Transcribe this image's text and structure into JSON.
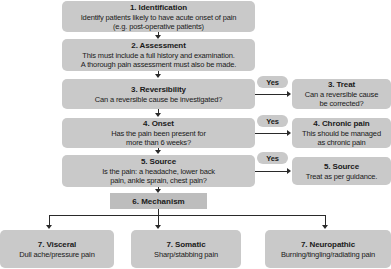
{
  "diagram": {
    "colors": {
      "box_fill": "#c9c9c9",
      "mechanism_fill": "#bdbdbd",
      "connector": "#2a2a2a",
      "text": "#1a1a1a",
      "background": "#ffffff"
    },
    "main_steps": [
      {
        "id": "identification",
        "title": "1. Identification",
        "line1": "Identify patients likely to have acute onset of pain",
        "line2": "(e.g. post-operative patients)"
      },
      {
        "id": "assessment",
        "title": "2. Assessment",
        "line1": "This must include a full history and examination.",
        "line2": "A thorough pain assessment must also be made."
      },
      {
        "id": "reversibility",
        "title": "3. Reversibility",
        "line1": "Can a reversible cause be investigated?",
        "line2": ""
      },
      {
        "id": "onset",
        "title": "4. Onset",
        "line1": "Has the pain been present for",
        "line2": "more than 6 weeks?"
      },
      {
        "id": "source",
        "title": "5. Source",
        "line1": "Is the pain: a headache, lower back",
        "line2": "pain, ankle sprain, chest pain?"
      }
    ],
    "branch_label": "Yes",
    "branch_outcomes": [
      {
        "id": "treat",
        "title": "3. Treat",
        "line1": "Can a reversible cause",
        "line2": "be corrected?"
      },
      {
        "id": "chronic-pain",
        "title": "4. Chronic pain",
        "line1": "This should be managed",
        "line2": "as chronic pain"
      },
      {
        "id": "source-treat",
        "title": "5. Source",
        "line1": "Treat as per guidance.",
        "line2": ""
      }
    ],
    "mechanism": {
      "id": "mechanism",
      "title": "6. Mechanism"
    },
    "pain_types": [
      {
        "id": "visceral",
        "title": "7. Visceral",
        "line1": "Dull ache/pressure pain",
        "line2": ""
      },
      {
        "id": "somatic",
        "title": "7. Somatic",
        "line1": "Sharp/stabbing pain",
        "line2": ""
      },
      {
        "id": "neuropathic",
        "title": "7. Neuropathic",
        "line1": "Burning/tingling/radiating pain",
        "line2": ""
      }
    ]
  }
}
